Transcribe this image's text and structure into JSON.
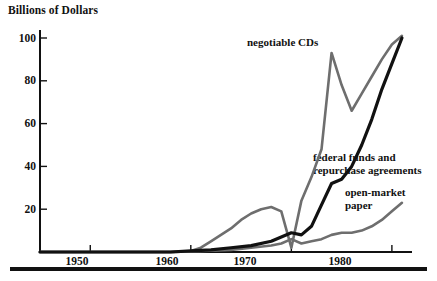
{
  "chart_data": {
    "type": "line",
    "title": "",
    "ylabel": "Billions of Dollars",
    "xlabel": "",
    "xlim": [
      1945,
      1982
    ],
    "ylim": [
      0,
      105
    ],
    "grid": false,
    "legend_position": "inline-annotations",
    "yticks": [
      20,
      40,
      60,
      80,
      100
    ],
    "ytick_labels": [
      "20",
      "40",
      "60",
      "80",
      "100"
    ],
    "xticks": [
      1950,
      1960,
      1970,
      1980
    ],
    "xtick_labels": [
      "1950",
      "1960",
      "1970",
      "1980"
    ],
    "series": [
      {
        "name": "negotiable CDs",
        "color": "#6e6e6e",
        "x": [
          1945,
          1950,
          1955,
          1958,
          1960,
          1961,
          1962,
          1963,
          1964,
          1965,
          1966,
          1967,
          1968,
          1969,
          1970,
          1971,
          1972,
          1973,
          1974,
          1975,
          1976,
          1977,
          1978,
          1979,
          1980,
          1981
        ],
        "values": [
          0,
          0,
          0,
          0,
          0.5,
          2,
          5,
          8,
          11,
          15,
          18,
          20,
          21,
          19,
          2,
          24,
          35,
          48,
          93,
          78,
          66,
          74,
          82,
          90,
          97,
          101
        ]
      },
      {
        "name": "federal funds and repurchase agreements",
        "color": "#111111",
        "x": [
          1945,
          1950,
          1955,
          1958,
          1960,
          1962,
          1964,
          1966,
          1968,
          1969,
          1970,
          1971,
          1972,
          1973,
          1974,
          1975,
          1976,
          1977,
          1978,
          1979,
          1980,
          1981
        ],
        "values": [
          0,
          0,
          0,
          0,
          0.5,
          1,
          2,
          3,
          5,
          7,
          9,
          8,
          12,
          22,
          32,
          34,
          40,
          50,
          62,
          76,
          88,
          100
        ]
      },
      {
        "name": "open-market paper",
        "color": "#6e6e6e",
        "x": [
          1945,
          1950,
          1955,
          1958,
          1960,
          1962,
          1964,
          1966,
          1968,
          1969,
          1970,
          1971,
          1972,
          1973,
          1974,
          1975,
          1976,
          1977,
          1978,
          1979,
          1980,
          1981
        ],
        "values": [
          0,
          0,
          0,
          0,
          0.3,
          0.6,
          1,
          2,
          3,
          4,
          6,
          4,
          5,
          6,
          8,
          9,
          9,
          10,
          12,
          15,
          19,
          23
        ]
      }
    ],
    "annotations": [
      {
        "text": "negotiable CDs",
        "series": "negotiable CDs"
      },
      {
        "text_line1": "federal funds and",
        "text_line2": "repurchase agreements",
        "series": "federal funds and repurchase agreements"
      },
      {
        "text_line1": "open-market",
        "text_line2": "paper",
        "series": "open-market paper"
      }
    ]
  },
  "labels": {
    "axis_title": "Billions of Dollars",
    "y_100": "100",
    "y_80": "80",
    "y_60": "60",
    "y_40": "40",
    "y_20": "20",
    "x_1950": "1950",
    "x_1960": "1960",
    "x_1970": "1970",
    "x_1980": "1980",
    "cds": "negotiable CDs",
    "ff_line1": "federal funds and",
    "ff_line2": "repurchase agreements",
    "omp_line1": "open-market",
    "omp_line2": "paper"
  },
  "colors": {
    "axis": "#111111",
    "series_gray": "#6e6e6e",
    "series_black": "#111111",
    "background": "#ffffff"
  }
}
